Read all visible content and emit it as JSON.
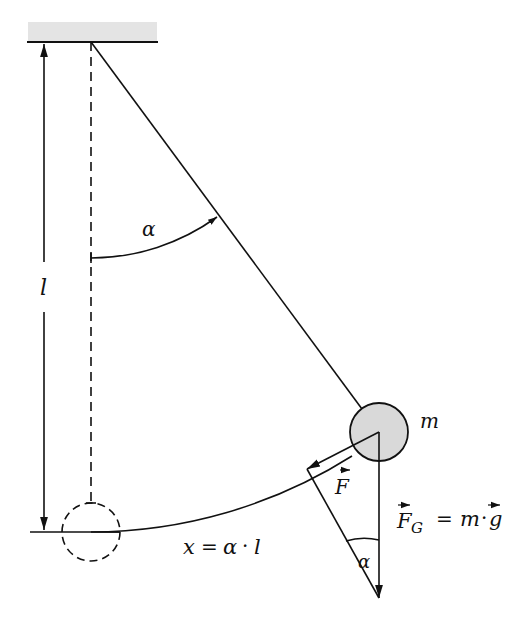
{
  "diagram": {
    "labels": {
      "length": "l",
      "angle_top": "α",
      "mass": "m",
      "force_tangential": "F",
      "gravity_lhs": "F",
      "gravity_sub": "G",
      "gravity_eq": "=",
      "gravity_m": "m",
      "gravity_dot": "·",
      "gravity_g": "g",
      "arc_x": "x",
      "arc_eq": "=",
      "arc_alpha": "α",
      "arc_dot": "·",
      "arc_l": "l",
      "angle_bottom": "α"
    },
    "colors": {
      "ceiling_fill": "#e4e4e4",
      "bob_fill": "#d9d9d9",
      "stroke": "#111111"
    },
    "geometry": {
      "pivot": [
        91,
        42
      ],
      "bob_center": [
        379,
        432
      ],
      "bob_radius": 29,
      "rest_center": [
        91,
        532
      ],
      "string_length": 490
    }
  }
}
